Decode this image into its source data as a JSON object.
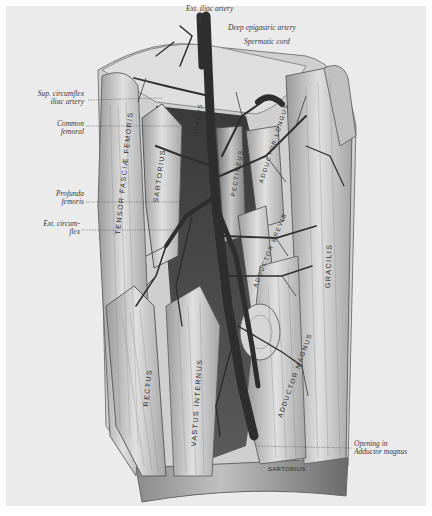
{
  "figure": {
    "background": "#ebebeb",
    "ink": "#2a2a2a",
    "vessel_color": "#2e2e2e"
  },
  "labels_top": {
    "ext_iliac": "Ext. iliac artery",
    "deep_epigastric": "Deep epigastric artery",
    "spermatic_cord": "Spermatic cord"
  },
  "labels_left": {
    "sup_circumflex_1": "Sup. circumflex",
    "sup_circumflex_2": "iliac artery",
    "common_femoral_1": "Common",
    "common_femoral_2": "femoral",
    "profunda_1": "Profunda",
    "profunda_2": "femoris",
    "ext_circum_1": "Ext. circum-",
    "ext_circum_2": "flex"
  },
  "labels_right": {
    "opening_1": "Opening in",
    "opening_2": "Adductor magnus"
  },
  "muscles": {
    "tensor": "TENSOR FASCIÆ FEMORIS",
    "sartorius": "SARTORIUS",
    "rectus": "RECTUS",
    "vastus": "VASTUS INTERNUS",
    "pectineus": "PECTINEUS",
    "adductor_longus": "ADDUCTOR LONGUS",
    "adductor_brevis": "ADDUCTOR BREVIS",
    "adductor_magnus": "ADDUCTOR MAGNUS",
    "gracilis": "GRACILIS",
    "sartorius_bottom": "SARTORIUS",
    "iliacus": "ILIACUS"
  }
}
